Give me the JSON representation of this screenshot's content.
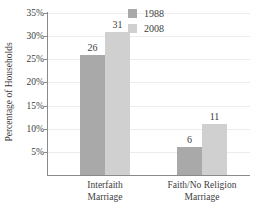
{
  "chart_data": {
    "type": "bar",
    "title": "",
    "xlabel": "",
    "ylabel": "Percentage of Households",
    "categories": [
      "Interfaith\nMarriage",
      "Faith/No Religion\nMarriage"
    ],
    "category_lines": [
      [
        "Interfaith",
        "Marriage"
      ],
      [
        "Faith/No Religion",
        "Marriage"
      ]
    ],
    "series": [
      {
        "name": "1988",
        "values": [
          26,
          6
        ],
        "color": "#a9a9a9"
      },
      {
        "name": "2008",
        "values": [
          31,
          11
        ],
        "color": "#d0d0d0"
      }
    ],
    "ylim": [
      0,
      35
    ],
    "ytick_values": [
      5,
      10,
      15,
      20,
      25,
      30,
      35
    ],
    "ytick_labels": [
      "5%",
      "10%",
      "15%",
      "20%",
      "25%",
      "30%",
      "35%"
    ],
    "grid": "horizontal",
    "legend_position": "top-right",
    "data_labels": [
      "26",
      "31",
      "6",
      "11"
    ]
  },
  "axes": {
    "y_title": "Percentage of Households"
  },
  "legend": {
    "entries": [
      {
        "label": "1988",
        "color": "#a9a9a9"
      },
      {
        "label": "2008",
        "color": "#d0d0d0"
      }
    ]
  }
}
